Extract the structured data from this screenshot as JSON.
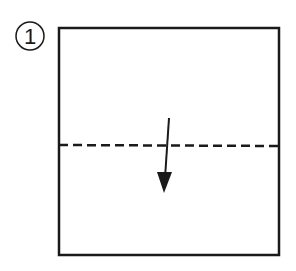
{
  "step": {
    "number": "1"
  },
  "diagram": {
    "paper": {
      "x": 59,
      "y": 28,
      "width": 220,
      "height": 227
    },
    "fold_line": {
      "type": "valley-fold",
      "y": 145
    },
    "arrow": {
      "direction": "down",
      "x1": 169,
      "y1": 118,
      "x2": 164,
      "y2": 192
    }
  },
  "colors": {
    "ink": "#1a1a1a",
    "background": "#ffffff"
  }
}
